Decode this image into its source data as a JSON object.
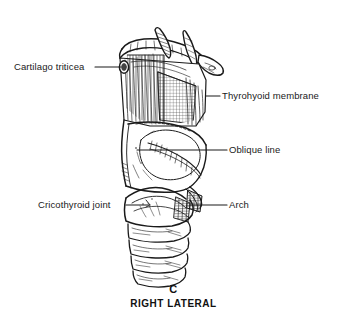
{
  "figure": {
    "view": "right lateral",
    "panel_letter": "C",
    "view_caption": "RIGHT LATERAL",
    "background_color": "#ffffff",
    "ink_color": "#1a1a1a",
    "width_px": 347,
    "height_px": 321
  },
  "labels": [
    {
      "id": "cartilago-triticea",
      "text": "Cartilago triticea",
      "side": "left",
      "text_x": 14,
      "text_y": 62,
      "leader_from_x": 95,
      "leader_from_y": 67,
      "leader_to_x": 121,
      "leader_to_y": 67
    },
    {
      "id": "thyrohyoid-membrane",
      "text": "Thyrohyoid membrane",
      "side": "right",
      "text_x": 222,
      "text_y": 91,
      "leader_from_x": 206,
      "leader_from_y": 96,
      "leader_to_x": 220,
      "leader_to_y": 96
    },
    {
      "id": "oblique-line",
      "text": "Oblique line",
      "side": "right",
      "text_x": 229,
      "text_y": 146,
      "leader_from_x": 137,
      "leader_from_y": 150,
      "leader_to_x": 227,
      "leader_to_y": 150
    },
    {
      "id": "cricothyroid-joint",
      "text": "Cricothyroid joint",
      "side": "left",
      "text_x": 38,
      "text_y": 200,
      "leader_from_x": 126,
      "leader_from_y": 205,
      "leader_to_x": 148,
      "leader_to_y": 205
    },
    {
      "id": "arch",
      "text": "Arch",
      "side": "right",
      "text_x": 229,
      "text_y": 200,
      "leader_from_x": 190,
      "leader_from_y": 205,
      "leader_to_x": 227,
      "leader_to_y": 205
    }
  ],
  "structures": [
    {
      "id": "hyoid-bone",
      "name": "Hyoid bone"
    },
    {
      "id": "greater-horn-hyoid",
      "name": "Greater horn of hyoid"
    },
    {
      "id": "superior-horn-thyroid",
      "name": "Superior horn of thyroid cartilage"
    },
    {
      "id": "thyrohyoid-membrane-sheet",
      "name": "Thyrohyoid membrane"
    },
    {
      "id": "cartilago-triticea-nodule",
      "name": "Cartilago triticea"
    },
    {
      "id": "thyroid-lamina",
      "name": "Lamina of thyroid cartilage"
    },
    {
      "id": "oblique-line-ridge",
      "name": "Oblique line"
    },
    {
      "id": "inferior-horn-thyroid",
      "name": "Inferior horn of thyroid cartilage"
    },
    {
      "id": "cricoid-cartilage",
      "name": "Cricoid cartilage"
    },
    {
      "id": "cricoid-arch",
      "name": "Arch of cricoid cartilage"
    },
    {
      "id": "cricothyroid-joint-facet",
      "name": "Cricothyroid joint"
    },
    {
      "id": "tracheal-ring-1",
      "name": "Tracheal ring 1"
    },
    {
      "id": "tracheal-ring-2",
      "name": "Tracheal ring 2"
    },
    {
      "id": "tracheal-ring-3",
      "name": "Tracheal ring 3"
    },
    {
      "id": "tracheal-ring-4",
      "name": "Tracheal ring 4"
    }
  ]
}
